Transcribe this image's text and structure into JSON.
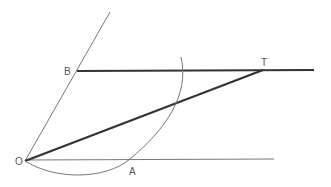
{
  "diagram": {
    "type": "geometric-construction",
    "points": {
      "O": {
        "label": "O",
        "x": 25,
        "y": 161
      },
      "A": {
        "label": "A",
        "x": 130,
        "y": 159
      },
      "B": {
        "label": "B",
        "x": 77,
        "y": 71
      },
      "T": {
        "label": "T",
        "x": 263,
        "y": 70
      }
    },
    "labels": {
      "O": "O",
      "A": "A",
      "B": "B",
      "T": "T"
    },
    "colors": {
      "thin_line": "#777777",
      "thick_line": "#333333",
      "arc": "#777777",
      "label": "#555555"
    }
  }
}
